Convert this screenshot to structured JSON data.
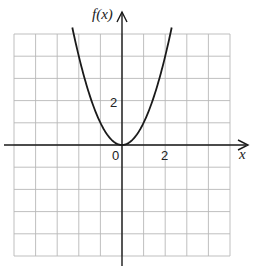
{
  "chart_data": {
    "type": "line",
    "title": "",
    "xlabel": "x",
    "ylabel": "f(x)",
    "function": "x^2",
    "xlim": [
      -5,
      5
    ],
    "ylim": [
      -5,
      5
    ],
    "grid": true,
    "grid_step": 1,
    "tick_labels": {
      "origin": "0",
      "x": [
        {
          "value": 2,
          "label": "2"
        }
      ],
      "y": [
        {
          "value": 2,
          "label": "2"
        }
      ]
    },
    "series": [
      {
        "name": "f(x)",
        "x": [
          -2.3,
          -2,
          -1.5,
          -1,
          -0.5,
          0,
          0.5,
          1,
          1.5,
          2,
          2.3
        ],
        "y": [
          5.29,
          4,
          2.25,
          1,
          0.25,
          0,
          0.25,
          1,
          2.25,
          4,
          5.29
        ]
      }
    ]
  },
  "colors": {
    "grid": "#b8b8b8",
    "axis": "#1a1a1a",
    "curve": "#1a1a1a"
  },
  "labels": {
    "y_axis": "f(x)",
    "x_axis": "x",
    "origin": "0",
    "x_tick_2": "2",
    "y_tick_2": "2"
  }
}
